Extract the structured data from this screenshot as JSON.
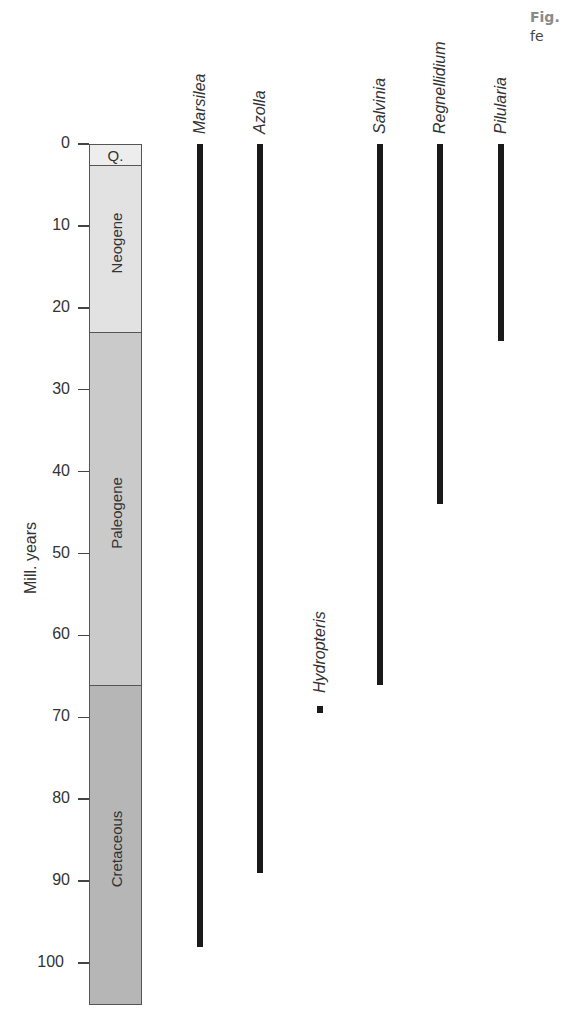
{
  "caption": {
    "line1": "Fig.",
    "line2": "fe"
  },
  "chart_data": {
    "type": "bar",
    "subtype": "stratigraphic range chart",
    "title": "",
    "xlabel": "",
    "ylabel": "Mill. years",
    "ylim": [
      0,
      105
    ],
    "y_inverted": true,
    "y_ticks": [
      0,
      10,
      20,
      30,
      40,
      50,
      60,
      70,
      80,
      90,
      100
    ],
    "grid": false,
    "legend": null,
    "periods": [
      {
        "name": "Q.",
        "start": 0,
        "end": 2.6,
        "color": "#ededed"
      },
      {
        "name": "Neogene",
        "start": 2.6,
        "end": 23,
        "color": "#e2e2e2"
      },
      {
        "name": "Paleogene",
        "start": 23,
        "end": 66,
        "color": "#cacaca"
      },
      {
        "name": "Cretaceous",
        "start": 66,
        "end": 105,
        "color": "#b6b6b6"
      }
    ],
    "taxa": [
      {
        "name": "Marsilea",
        "from": 0,
        "to": 98,
        "kind": "range",
        "x": 200
      },
      {
        "name": "Azolla",
        "from": 0,
        "to": 89,
        "kind": "range",
        "x": 260
      },
      {
        "name": "Hydropteris",
        "from": 69,
        "to": 69,
        "kind": "point",
        "x": 320
      },
      {
        "name": "Salvinia",
        "from": 0,
        "to": 66,
        "kind": "range",
        "x": 380
      },
      {
        "name": "Regnellidium",
        "from": 0,
        "to": 44,
        "kind": "range",
        "x": 440
      },
      {
        "name": "Pilularia",
        "from": 0,
        "to": 24,
        "kind": "range",
        "x": 501
      }
    ]
  }
}
